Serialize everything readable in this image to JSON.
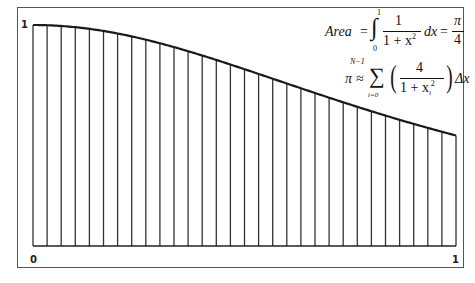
{
  "diagram": {
    "type": "riemann-sum",
    "function": "1/(1+x^2)",
    "x_range": [
      0,
      1
    ],
    "y_range": [
      0,
      1
    ],
    "intervals": 30,
    "labels": {
      "y_top": "1",
      "x_left": "0",
      "x_right": "1"
    },
    "formula1": {
      "lhs": "Area",
      "eq": "=",
      "upper": "1",
      "lower": "0",
      "num": "1",
      "den": "1 + x",
      "den_exp": "2",
      "dx": "dx",
      "eq2": "=",
      "rnum": "π",
      "rden": "4"
    },
    "formula2": {
      "lhs": "π",
      "approx": "≈",
      "sum_top": "N−1",
      "sum_bot": "i=0",
      "num": "4",
      "den": "1 + x",
      "den_sub": "i",
      "den_exp": "2",
      "dx": "Δx"
    },
    "colors": {
      "line": "#1a1a1a",
      "bar": "#333333",
      "border": "#555555"
    }
  }
}
